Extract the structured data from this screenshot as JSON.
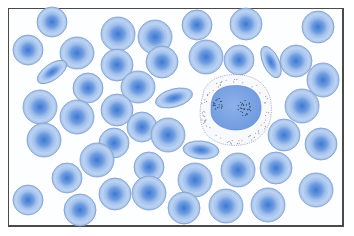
{
  "figure": {
    "colors": {
      "background": "#fdfeff",
      "frame_border": "#4a4a4a",
      "rbc_rim": "#b8d0f0",
      "rbc_body": "#a9c6ef",
      "rbc_center": "#4f86d9",
      "rbc_outline": "#7f9cc4",
      "wbc_cytoplasm": "#f7f9fc",
      "wbc_outline": "#9aa6b8",
      "wbc_nucleus": "#7aa3e3",
      "wbc_granules": "#2e3f5a"
    },
    "red_blood_cells": [
      {
        "cx": 52,
        "cy": 22,
        "rx": 15,
        "ry": 15,
        "rot": 0
      },
      {
        "cx": 28,
        "cy": 50,
        "rx": 15,
        "ry": 15,
        "rot": 0
      },
      {
        "cx": 77,
        "cy": 53,
        "rx": 17,
        "ry": 16,
        "rot": 0
      },
      {
        "cx": 52,
        "cy": 72,
        "rx": 17,
        "ry": 8,
        "rot": -35
      },
      {
        "cx": 118,
        "cy": 34,
        "rx": 17,
        "ry": 17,
        "rot": 0
      },
      {
        "cx": 155,
        "cy": 37,
        "rx": 17,
        "ry": 17,
        "rot": 0
      },
      {
        "cx": 197,
        "cy": 25,
        "rx": 15,
        "ry": 15,
        "rot": 0
      },
      {
        "cx": 246,
        "cy": 24,
        "rx": 16,
        "ry": 16,
        "rot": 0
      },
      {
        "cx": 318,
        "cy": 27,
        "rx": 16,
        "ry": 16,
        "rot": 0
      },
      {
        "cx": 117,
        "cy": 65,
        "rx": 16,
        "ry": 16,
        "rot": 0
      },
      {
        "cx": 162,
        "cy": 62,
        "rx": 16,
        "ry": 16,
        "rot": 0
      },
      {
        "cx": 206,
        "cy": 57,
        "rx": 17,
        "ry": 17,
        "rot": 0
      },
      {
        "cx": 239,
        "cy": 60,
        "rx": 15,
        "ry": 15,
        "rot": 0
      },
      {
        "cx": 271,
        "cy": 62,
        "rx": 17,
        "ry": 8,
        "rot": 65
      },
      {
        "cx": 296,
        "cy": 61,
        "rx": 16,
        "ry": 16,
        "rot": 0
      },
      {
        "cx": 323,
        "cy": 80,
        "rx": 16,
        "ry": 17,
        "rot": 0
      },
      {
        "cx": 88,
        "cy": 88,
        "rx": 15,
        "ry": 15,
        "rot": 0
      },
      {
        "cx": 138,
        "cy": 87,
        "rx": 17,
        "ry": 16,
        "rot": 0
      },
      {
        "cx": 174,
        "cy": 98,
        "rx": 19,
        "ry": 9,
        "rot": -15
      },
      {
        "cx": 40,
        "cy": 107,
        "rx": 17,
        "ry": 17,
        "rot": 0
      },
      {
        "cx": 77,
        "cy": 117,
        "rx": 17,
        "ry": 17,
        "rot": 0
      },
      {
        "cx": 117,
        "cy": 110,
        "rx": 16,
        "ry": 16,
        "rot": 0
      },
      {
        "cx": 302,
        "cy": 106,
        "rx": 17,
        "ry": 17,
        "rot": 0
      },
      {
        "cx": 44,
        "cy": 140,
        "rx": 17,
        "ry": 17,
        "rot": 0
      },
      {
        "cx": 142,
        "cy": 127,
        "rx": 15,
        "ry": 15,
        "rot": 0
      },
      {
        "cx": 168,
        "cy": 135,
        "rx": 17,
        "ry": 17,
        "rot": 0
      },
      {
        "cx": 114,
        "cy": 143,
        "rx": 15,
        "ry": 15,
        "rot": 0
      },
      {
        "cx": 201,
        "cy": 150,
        "rx": 18,
        "ry": 9,
        "rot": 5
      },
      {
        "cx": 284,
        "cy": 135,
        "rx": 16,
        "ry": 16,
        "rot": 0
      },
      {
        "cx": 321,
        "cy": 144,
        "rx": 16,
        "ry": 16,
        "rot": 0
      },
      {
        "cx": 67,
        "cy": 178,
        "rx": 15,
        "ry": 15,
        "rot": 0
      },
      {
        "cx": 97,
        "cy": 160,
        "rx": 17,
        "ry": 17,
        "rot": 0
      },
      {
        "cx": 149,
        "cy": 167,
        "rx": 15,
        "ry": 15,
        "rot": 0
      },
      {
        "cx": 195,
        "cy": 180,
        "rx": 17,
        "ry": 17,
        "rot": 0
      },
      {
        "cx": 238,
        "cy": 170,
        "rx": 17,
        "ry": 17,
        "rot": 0
      },
      {
        "cx": 276,
        "cy": 168,
        "rx": 16,
        "ry": 16,
        "rot": 0
      },
      {
        "cx": 28,
        "cy": 200,
        "rx": 15,
        "ry": 15,
        "rot": 0
      },
      {
        "cx": 80,
        "cy": 210,
        "rx": 16,
        "ry": 16,
        "rot": 0
      },
      {
        "cx": 115,
        "cy": 194,
        "rx": 16,
        "ry": 16,
        "rot": 0
      },
      {
        "cx": 149,
        "cy": 193,
        "rx": 17,
        "ry": 17,
        "rot": 0
      },
      {
        "cx": 184,
        "cy": 208,
        "rx": 16,
        "ry": 16,
        "rot": 0
      },
      {
        "cx": 226,
        "cy": 206,
        "rx": 17,
        "ry": 17,
        "rot": 0
      },
      {
        "cx": 268,
        "cy": 205,
        "rx": 17,
        "ry": 17,
        "rot": 0
      },
      {
        "cx": 316,
        "cy": 190,
        "rx": 17,
        "ry": 17,
        "rot": 0
      }
    ],
    "white_blood_cell": {
      "cx": 235,
      "cy": 111,
      "cytoplasm_path": "M203,95 C205,80 222,73 240,75 C258,76 270,88 271,104 C273,118 268,134 252,142 C238,148 218,146 208,136 C198,126 199,108 203,95 Z",
      "nucleus_path": "M212,100 C214,88 228,84 242,86 C256,88 262,98 261,110 C260,122 250,130 236,130 C222,130 211,122 211,112 C211,106 211,103 212,100 Z",
      "granule_clusters": [
        {
          "cx": 218,
          "cy": 104,
          "r": 5,
          "n": 18
        },
        {
          "cx": 245,
          "cy": 108,
          "r": 7,
          "n": 28
        }
      ]
    }
  }
}
